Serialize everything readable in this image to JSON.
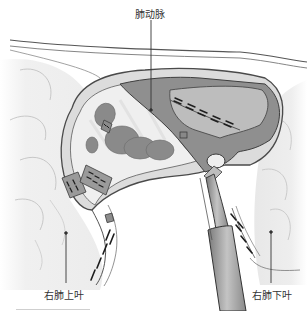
{
  "figure": {
    "type": "surgical-illustration",
    "labels": {
      "pulmonary_artery": "肺动脉",
      "right_upper_lobe": "右肺上叶",
      "right_lower_lobe": "右肺下叶"
    },
    "colors": {
      "artery_fill": "#8f8f8f",
      "tissue_fill": "#e6e6e6",
      "lymph_node_fill": "#8a8a8a",
      "lung_fill": "#f2f2f2",
      "outline": "#444444",
      "instrument_fill": "#a8a8a8",
      "staple": "#222222"
    }
  }
}
